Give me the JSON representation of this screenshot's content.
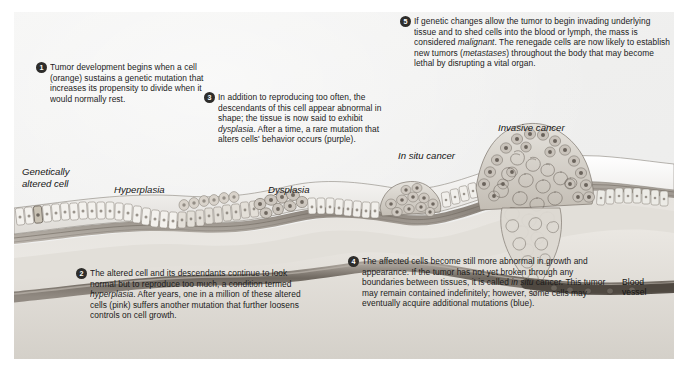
{
  "figure": {
    "panel_color": "#f1f1f0",
    "badge_color": "#2e2d2b",
    "badge_text_color": "#ffffff"
  },
  "callouts": [
    {
      "number": "1",
      "text": "Tumor development begins when a cell (orange) sustains a genetic mutation that increases its propensity to divide when it would normally rest."
    },
    {
      "number": "2",
      "text": "The altered cell and its descendants continue to look normal but to reproduce too much, a condition termed hyperplasia. After years, one in a million of these altered cells (pink) suffers another mutation that further loosens controls on cell growth."
    },
    {
      "number": "3",
      "text": "In addition to reproducing too often, the descendants of this cell appear abnormal in shape; the tissue is now said to exhibit dysplasia. After a time, a rare mutation that alters cells' behavior occurs (purple)."
    },
    {
      "number": "4",
      "text": "The affected cells become still more abnormal in growth and appearance. If the tumor has not yet broken through any boundaries between tissues, it is called in situ cancer. This tumor may remain contained indefinitely; however, some cells may eventually acquire additional mutations (blue)."
    },
    {
      "number": "5",
      "text": "If genetic changes allow the tumor to begin invading underlying tissue and to shed cells into the blood or lymph, the mass is considered malignant. The renegade cells are now likely to establish new tumors (metastases) throughout the body that may become lethal by disrupting a vital organ."
    }
  ],
  "labels": {
    "genetically_altered_cell": "Genetically\naltered cell",
    "hyperplasia": "Hyperplasia",
    "dysplasia": "Dysplasia",
    "in_situ_cancer": "In situ cancer",
    "invasive_cancer": "Invasive cancer",
    "blood_vessel": "Blood\nvessel"
  },
  "cell_colors": {
    "normal": "#e9e7e2",
    "altered_orange": "#c9c3b6",
    "hyperplasia_pink": "#d8d2cb",
    "dysplasia_purple": "#b9b4ae",
    "invasive_blue": "#a9a39c",
    "basement_membrane": "#8d877f",
    "vessel": "#7a736c"
  }
}
